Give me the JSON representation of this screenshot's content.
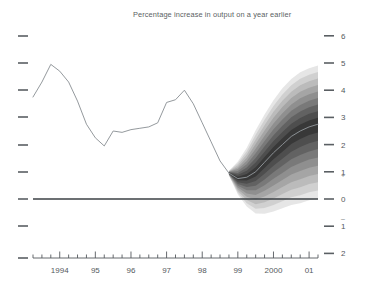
{
  "chart": {
    "title": "Percentage increase in output on a year earlier",
    "sign_positive": "+",
    "sign_negative": "–"
  },
  "chart_data": {
    "type": "area",
    "title": "Percentage increase in output on a year earlier",
    "subtitle": "",
    "xlabel": "",
    "ylabel": "",
    "grid": false,
    "legend": "none",
    "xlim": [
      1993.25,
      2001.25
    ],
    "ylim": [
      -2,
      6
    ],
    "y_ticks": [
      6,
      5,
      4,
      3,
      2,
      1,
      0,
      -1,
      -2
    ],
    "y_tick_labels": [
      "6",
      "5",
      "4",
      "3",
      "2",
      "1",
      "0",
      "1",
      "2"
    ],
    "x_tick_labels": [
      "1994",
      "95",
      "96",
      "97",
      "98",
      "99",
      "2000",
      "01"
    ],
    "x_tick_values": [
      1994,
      1995,
      1996,
      1997,
      1998,
      1999,
      2000,
      2001
    ],
    "x_minor_ticks_per_year": 4,
    "zero_line": 0,
    "series": [
      {
        "name": "Outturn (historical GDP growth)",
        "type": "line",
        "x": [
          1993.25,
          1993.5,
          1993.75,
          1994.0,
          1994.25,
          1994.5,
          1994.75,
          1995.0,
          1995.25,
          1995.5,
          1995.75,
          1996.0,
          1996.25,
          1996.5,
          1996.75,
          1997.0,
          1997.25,
          1997.5,
          1997.75,
          1998.0,
          1998.25,
          1998.5,
          1998.75
        ],
        "values": [
          3.75,
          4.3,
          4.95,
          4.7,
          4.3,
          3.6,
          2.75,
          2.25,
          1.95,
          2.5,
          2.45,
          2.55,
          2.6,
          2.65,
          2.8,
          3.55,
          3.65,
          4.0,
          3.5,
          2.8,
          2.1,
          1.4,
          0.95
        ]
      },
      {
        "name": "Forecast central projection",
        "type": "line",
        "x": [
          1998.75,
          1999.0,
          1999.25,
          1999.5,
          1999.75,
          2000.0,
          2000.25,
          2000.5,
          2000.75,
          2001.0,
          2001.25
        ],
        "values": [
          0.95,
          0.75,
          0.8,
          1.0,
          1.35,
          1.7,
          2.0,
          2.3,
          2.5,
          2.65,
          2.75
        ]
      }
    ],
    "fan_bands": {
      "description": "Probability distribution fan around the central projection, 90% outer band",
      "x": [
        1998.75,
        1999.0,
        1999.25,
        1999.5,
        1999.75,
        2000.0,
        2000.25,
        2000.5,
        2000.75,
        2001.0,
        2001.25
      ],
      "upper_90": [
        1.05,
        1.45,
        2.0,
        2.7,
        3.3,
        3.85,
        4.3,
        4.65,
        4.9,
        5.05,
        5.15
      ],
      "lower_90": [
        0.85,
        0.1,
        -0.4,
        -0.7,
        -0.75,
        -0.7,
        -0.6,
        -0.5,
        -0.45,
        -0.35,
        -0.3
      ],
      "bands": [
        10,
        20,
        30,
        40,
        50,
        60,
        70,
        80,
        90
      ]
    }
  }
}
